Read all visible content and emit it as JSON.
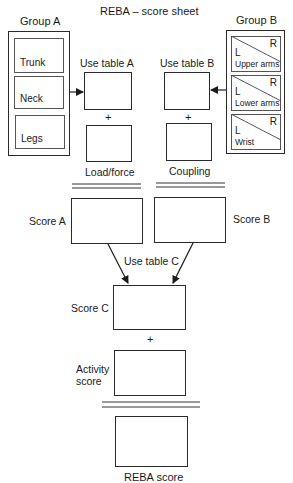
{
  "title": "REBA – score sheet",
  "group_a": {
    "label": "Group A",
    "items": [
      "Trunk",
      "Neck",
      "Legs"
    ]
  },
  "group_b": {
    "label": "Group B",
    "items": [
      {
        "label": "Upper arms",
        "left": "L",
        "right": "R"
      },
      {
        "label": "Lower arms",
        "left": "L",
        "right": "R"
      },
      {
        "label": "Wrist",
        "left": "L",
        "right": "R"
      }
    ]
  },
  "table_a": {
    "label": "Use table A",
    "plus": "+",
    "addend_label": "Load/force"
  },
  "table_b": {
    "label": "Use table B",
    "plus": "+",
    "addend_label": "Coupling"
  },
  "score_a": {
    "label": "Score A"
  },
  "score_b": {
    "label": "Score B"
  },
  "table_c": {
    "label": "Use table C"
  },
  "score_c": {
    "label": "Score C",
    "plus": "+"
  },
  "activity": {
    "label_line1": "Activity",
    "label_line2": "score"
  },
  "reba": {
    "label": "REBA score"
  },
  "colors": {
    "line": "#2a2a2a",
    "background": "#ffffff"
  }
}
